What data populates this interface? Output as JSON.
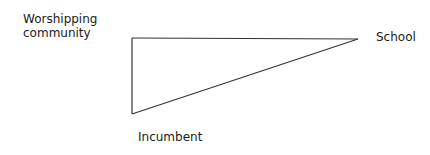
{
  "diagram": {
    "type": "triangle",
    "nodes": [
      {
        "id": "worshipping-community",
        "label": "Worshipping community",
        "vertex": [
          132,
          38
        ]
      },
      {
        "id": "school",
        "label": "School",
        "vertex": [
          358,
          39
        ]
      },
      {
        "id": "incumbent",
        "label": "Incumbent",
        "vertex": [
          132,
          114
        ]
      }
    ],
    "edges": [
      {
        "from": "worshipping-community",
        "to": "school"
      },
      {
        "from": "school",
        "to": "incumbent"
      },
      {
        "from": "incumbent",
        "to": "worshipping-community"
      }
    ],
    "stroke_color": "#333333"
  }
}
